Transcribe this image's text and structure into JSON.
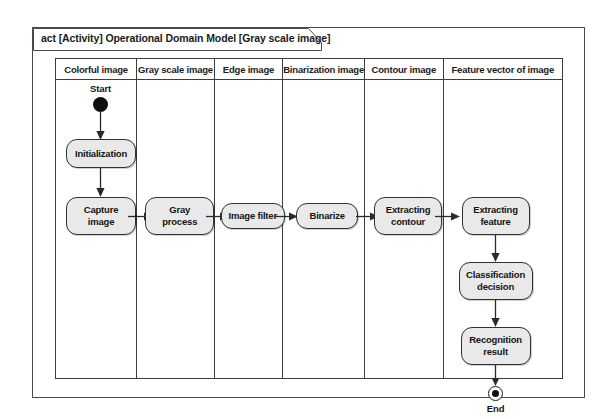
{
  "diagram": {
    "frame_title": "act [Activity] Operational Domain Model [Gray scale image]",
    "type": "uml-activity-diagram-with-swimlanes",
    "lanes": [
      {
        "header": "Colorful image"
      },
      {
        "header": "Gray scale image"
      },
      {
        "header": "Edge image"
      },
      {
        "header": "Binarization image"
      },
      {
        "header": "Contour image"
      },
      {
        "header": "Feature vector of image"
      }
    ],
    "nodes": {
      "start_label": "Start",
      "initialization": "Initialization",
      "capture_image": "Capture\nimage",
      "capture_image_line1": "Capture",
      "capture_image_line2": "image",
      "gray_process_line1": "Gray",
      "gray_process_line2": "process",
      "image_filter": "Image filter",
      "binarize": "Binarize",
      "extracting_contour_line1": "Extracting",
      "extracting_contour_line2": "contour",
      "extracting_feature_line1": "Extracting",
      "extracting_feature_line2": "feature",
      "classification_decision_line1": "Classification",
      "classification_decision_line2": "decision",
      "recognition_result_line1": "Recognition",
      "recognition_result_line2": "result",
      "end_label": "End"
    },
    "colors": {
      "node_fill": "#e9e9e9",
      "node_border": "#313131",
      "frame_border": "#4a4a4a",
      "lane_border": "#3d3d3d",
      "text": "#141414",
      "background": "#ffffff"
    }
  }
}
